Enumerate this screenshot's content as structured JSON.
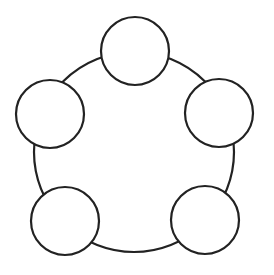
{
  "diagram": {
    "type": "ring-of-nodes",
    "stroke_color": "#222222",
    "fill_color": "#ffffff",
    "background_color": "#ffffff",
    "ring": {
      "label": ""
    },
    "nodes": [
      {
        "id": "top",
        "label": ""
      },
      {
        "id": "upper-right",
        "label": ""
      },
      {
        "id": "lower-right",
        "label": ""
      },
      {
        "id": "lower-left",
        "label": ""
      },
      {
        "id": "upper-left",
        "label": ""
      }
    ]
  }
}
